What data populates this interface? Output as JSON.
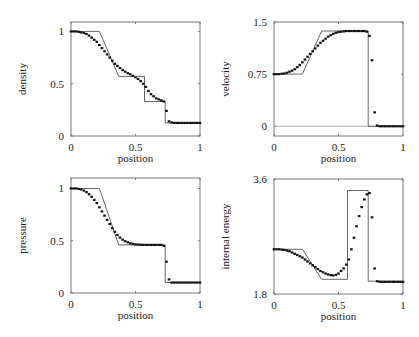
{
  "chart_data": [
    {
      "id": "density",
      "type": "line",
      "title": "",
      "xlabel": "position",
      "ylabel": "density",
      "xlim": [
        0,
        1
      ],
      "ylim": [
        0,
        1.09
      ],
      "xticks": [
        "0",
        "0.5",
        "1"
      ],
      "yticks": [
        {
          "v": 0,
          "label": "0"
        },
        {
          "v": 0.5,
          "label": "0.5"
        },
        {
          "v": 1,
          "label": "1"
        }
      ],
      "grid": false,
      "frame": {
        "x": 71,
        "y": 22,
        "w": 129,
        "h": 114
      },
      "exact": {
        "x": [
          0,
          0.22,
          0.37,
          0.57,
          0.57,
          0.73,
          0.73,
          1
        ],
        "y": [
          1,
          1,
          0.57,
          0.57,
          0.33,
          0.33,
          0.125,
          0.125
        ]
      },
      "series": [
        {
          "name": "numerical",
          "x": [
            0,
            0.02,
            0.04,
            0.06,
            0.08,
            0.1,
            0.12,
            0.14,
            0.16,
            0.18,
            0.2,
            0.22,
            0.24,
            0.26,
            0.28,
            0.3,
            0.32,
            0.34,
            0.36,
            0.38,
            0.4,
            0.42,
            0.44,
            0.46,
            0.48,
            0.5,
            0.52,
            0.54,
            0.56,
            0.58,
            0.6,
            0.62,
            0.64,
            0.66,
            0.68,
            0.7,
            0.72,
            0.74,
            0.76,
            0.78,
            0.8,
            0.82,
            0.84,
            0.86,
            0.88,
            0.9,
            0.92,
            0.94,
            0.96,
            0.98,
            1.0
          ],
          "y": [
            1,
            1,
            1,
            0.995,
            0.99,
            0.985,
            0.975,
            0.96,
            0.94,
            0.92,
            0.9,
            0.87,
            0.84,
            0.81,
            0.78,
            0.75,
            0.72,
            0.69,
            0.67,
            0.65,
            0.63,
            0.615,
            0.6,
            0.59,
            0.575,
            0.56,
            0.545,
            0.525,
            0.5,
            0.47,
            0.43,
            0.4,
            0.38,
            0.36,
            0.35,
            0.34,
            0.33,
            0.24,
            0.14,
            0.13,
            0.125,
            0.125,
            0.125,
            0.125,
            0.125,
            0.125,
            0.125,
            0.125,
            0.125,
            0.125,
            0.125
          ]
        }
      ]
    },
    {
      "id": "velocity",
      "type": "line",
      "title": "",
      "xlabel": "position",
      "ylabel": "velocity",
      "xlim": [
        0,
        1
      ],
      "ylim": [
        -0.14,
        1.5
      ],
      "xticks": [
        "0",
        "0.5",
        "1"
      ],
      "yticks": [
        {
          "v": 0,
          "label": "0"
        },
        {
          "v": 0.75,
          "label": "0.75"
        },
        {
          "v": 1.5,
          "label": "1.5"
        }
      ],
      "grid": false,
      "zero_line": true,
      "frame": {
        "x": 274,
        "y": 22,
        "w": 129,
        "h": 114
      },
      "exact": {
        "x": [
          0,
          0.22,
          0.37,
          0.73,
          0.73,
          1
        ],
        "y": [
          0.75,
          0.75,
          1.37,
          1.37,
          0,
          0
        ]
      },
      "series": [
        {
          "name": "numerical",
          "x": [
            0,
            0.02,
            0.04,
            0.06,
            0.08,
            0.1,
            0.12,
            0.14,
            0.16,
            0.18,
            0.2,
            0.22,
            0.24,
            0.26,
            0.28,
            0.3,
            0.32,
            0.34,
            0.36,
            0.38,
            0.4,
            0.42,
            0.44,
            0.46,
            0.48,
            0.5,
            0.52,
            0.54,
            0.56,
            0.58,
            0.6,
            0.62,
            0.64,
            0.66,
            0.68,
            0.7,
            0.72,
            0.74,
            0.76,
            0.78,
            0.8,
            0.82,
            0.84,
            0.86,
            0.88,
            0.9,
            0.92,
            0.94,
            0.96,
            0.98,
            1.0
          ],
          "y": [
            0.75,
            0.75,
            0.75,
            0.755,
            0.76,
            0.77,
            0.785,
            0.8,
            0.82,
            0.85,
            0.88,
            0.92,
            0.96,
            1.0,
            1.04,
            1.08,
            1.12,
            1.16,
            1.2,
            1.23,
            1.26,
            1.29,
            1.31,
            1.33,
            1.345,
            1.355,
            1.36,
            1.365,
            1.37,
            1.37,
            1.37,
            1.37,
            1.37,
            1.37,
            1.37,
            1.37,
            1.36,
            1.3,
            0.95,
            0.2,
            0.01,
            0,
            0,
            0,
            0,
            0,
            0,
            0,
            0,
            0,
            0
          ]
        }
      ]
    },
    {
      "id": "pressure",
      "type": "line",
      "title": "",
      "xlabel": "position",
      "ylabel": "pressure",
      "xlim": [
        0,
        1
      ],
      "ylim": [
        0,
        1.1
      ],
      "xticks": [
        "0",
        "0.5",
        "1"
      ],
      "yticks": [
        {
          "v": 0,
          "label": "0"
        },
        {
          "v": 0.5,
          "label": "0.5"
        },
        {
          "v": 1,
          "label": "1"
        }
      ],
      "grid": false,
      "frame": {
        "x": 71,
        "y": 178,
        "w": 129,
        "h": 115
      },
      "exact": {
        "x": [
          0,
          0.22,
          0.37,
          0.73,
          0.73,
          1
        ],
        "y": [
          1,
          1,
          0.46,
          0.46,
          0.1,
          0.1
        ]
      },
      "series": [
        {
          "name": "numerical",
          "x": [
            0,
            0.02,
            0.04,
            0.06,
            0.08,
            0.1,
            0.12,
            0.14,
            0.16,
            0.18,
            0.2,
            0.22,
            0.24,
            0.26,
            0.28,
            0.3,
            0.32,
            0.34,
            0.36,
            0.38,
            0.4,
            0.42,
            0.44,
            0.46,
            0.48,
            0.5,
            0.52,
            0.54,
            0.56,
            0.58,
            0.6,
            0.62,
            0.64,
            0.66,
            0.68,
            0.7,
            0.72,
            0.74,
            0.76,
            0.78,
            0.8,
            0.82,
            0.84,
            0.86,
            0.88,
            0.9,
            0.92,
            0.94,
            0.96,
            0.98,
            1.0
          ],
          "y": [
            1,
            1,
            1,
            0.995,
            0.99,
            0.98,
            0.965,
            0.945,
            0.92,
            0.89,
            0.86,
            0.82,
            0.78,
            0.74,
            0.7,
            0.66,
            0.62,
            0.585,
            0.555,
            0.53,
            0.51,
            0.495,
            0.485,
            0.475,
            0.47,
            0.465,
            0.463,
            0.462,
            0.461,
            0.46,
            0.46,
            0.46,
            0.46,
            0.46,
            0.46,
            0.46,
            0.45,
            0.3,
            0.13,
            0.1,
            0.1,
            0.1,
            0.1,
            0.1,
            0.1,
            0.1,
            0.1,
            0.1,
            0.1,
            0.1,
            0.1
          ]
        }
      ]
    },
    {
      "id": "internal_energy",
      "type": "line",
      "title": "",
      "xlabel": "position",
      "ylabel": "internal energy",
      "xlim": [
        0,
        1
      ],
      "ylim": [
        1.8,
        3.6
      ],
      "xticks": [
        "0",
        "0.5",
        "1"
      ],
      "yticks": [
        {
          "v": 1.8,
          "label": "1.8"
        },
        {
          "v": 3.6,
          "label": "3.6"
        }
      ],
      "grid": false,
      "frame": {
        "x": 274,
        "y": 179,
        "w": 129,
        "h": 115
      },
      "exact": {
        "x": [
          0,
          0.22,
          0.37,
          0.57,
          0.57,
          0.73,
          0.73,
          1
        ],
        "y": [
          2.5,
          2.5,
          2.03,
          2.03,
          3.42,
          3.42,
          2.0,
          2.0
        ]
      },
      "series": [
        {
          "name": "numerical",
          "x": [
            0,
            0.02,
            0.04,
            0.06,
            0.08,
            0.1,
            0.12,
            0.14,
            0.16,
            0.18,
            0.2,
            0.22,
            0.24,
            0.26,
            0.28,
            0.3,
            0.32,
            0.34,
            0.36,
            0.38,
            0.4,
            0.42,
            0.44,
            0.46,
            0.48,
            0.5,
            0.52,
            0.54,
            0.56,
            0.58,
            0.6,
            0.62,
            0.64,
            0.66,
            0.68,
            0.7,
            0.72,
            0.74,
            0.76,
            0.78,
            0.8,
            0.82,
            0.84,
            0.86,
            0.88,
            0.9,
            0.92,
            0.94,
            0.96,
            0.98,
            1.0
          ],
          "y": [
            2.5,
            2.5,
            2.5,
            2.495,
            2.49,
            2.48,
            2.47,
            2.45,
            2.43,
            2.41,
            2.39,
            2.37,
            2.34,
            2.31,
            2.28,
            2.25,
            2.22,
            2.19,
            2.16,
            2.14,
            2.12,
            2.105,
            2.095,
            2.09,
            2.1,
            2.12,
            2.16,
            2.2,
            2.26,
            2.34,
            2.5,
            2.68,
            2.86,
            3.02,
            3.16,
            3.28,
            3.36,
            3.38,
            3.0,
            2.2,
            2.0,
            1.99,
            1.99,
            1.99,
            1.99,
            1.99,
            1.99,
            1.99,
            1.99,
            1.99,
            1.99
          ]
        }
      ]
    }
  ]
}
